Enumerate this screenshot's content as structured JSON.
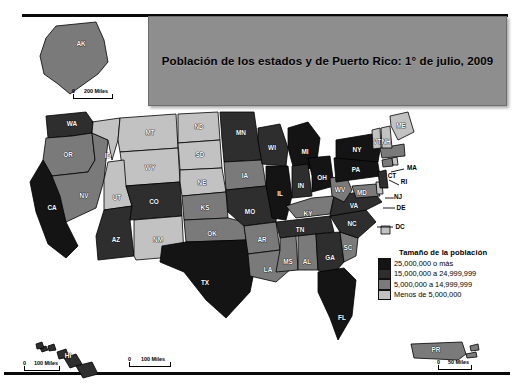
{
  "title": {
    "text": "Población de los estados y de Puerto Rico: 1° de julio, 2009"
  },
  "legend": {
    "title": "Tamaño de la población",
    "classes": [
      {
        "label": "25,000,000 o más",
        "color": "#141414"
      },
      {
        "label": "15,000,000 a 24,999,999",
        "color": "#2e2e2e"
      },
      {
        "label": "5,000,000 a 14,999,999",
        "color": "#7a7a7a"
      },
      {
        "label": "Menos de 5,000,000",
        "color": "#c2c2c2"
      }
    ]
  },
  "scales": {
    "main": {
      "zero": "0",
      "text": "100 Miles"
    },
    "alaska": {
      "zero": "0",
      "text": "200 Miles"
    },
    "hawaii": {
      "zero": "0",
      "text": "100 Miles"
    },
    "puertorico": {
      "zero": "0",
      "text": "50 Miles"
    }
  },
  "map_data": {
    "type": "choropleth",
    "ocean_color": "#ffffff",
    "border_color": "#000000",
    "states": [
      {
        "code": "AK",
        "class": 2,
        "color": "#7a7a7a"
      },
      {
        "code": "HI",
        "class": 1,
        "color": "#2e2e2e"
      },
      {
        "code": "PR",
        "class": 2,
        "color": "#7a7a7a"
      },
      {
        "code": "WA",
        "class": 1,
        "color": "#2e2e2e"
      },
      {
        "code": "OR",
        "class": 2,
        "color": "#7a7a7a"
      },
      {
        "code": "CA",
        "class": 0,
        "color": "#141414"
      },
      {
        "code": "NV",
        "class": 2,
        "color": "#7a7a7a"
      },
      {
        "code": "ID",
        "class": 3,
        "color": "#c2c2c2"
      },
      {
        "code": "MT",
        "class": 3,
        "color": "#c2c2c2"
      },
      {
        "code": "WY",
        "class": 3,
        "color": "#c2c2c2"
      },
      {
        "code": "UT",
        "class": 3,
        "color": "#c2c2c2"
      },
      {
        "code": "AZ",
        "class": 1,
        "color": "#2e2e2e"
      },
      {
        "code": "CO",
        "class": 1,
        "color": "#2e2e2e"
      },
      {
        "code": "NM",
        "class": 3,
        "color": "#c2c2c2"
      },
      {
        "code": "ND",
        "class": 3,
        "color": "#c2c2c2"
      },
      {
        "code": "SD",
        "class": 3,
        "color": "#c2c2c2"
      },
      {
        "code": "NE",
        "class": 3,
        "color": "#c2c2c2"
      },
      {
        "code": "KS",
        "class": 2,
        "color": "#7a7a7a"
      },
      {
        "code": "OK",
        "class": 2,
        "color": "#7a7a7a"
      },
      {
        "code": "TX",
        "class": 0,
        "color": "#141414"
      },
      {
        "code": "MN",
        "class": 1,
        "color": "#2e2e2e"
      },
      {
        "code": "IA",
        "class": 2,
        "color": "#7a7a7a"
      },
      {
        "code": "MO",
        "class": 1,
        "color": "#2e2e2e"
      },
      {
        "code": "AR",
        "class": 2,
        "color": "#7a7a7a"
      },
      {
        "code": "LA",
        "class": 2,
        "color": "#7a7a7a"
      },
      {
        "code": "WI",
        "class": 1,
        "color": "#2e2e2e"
      },
      {
        "code": "IL",
        "class": 0,
        "color": "#141414"
      },
      {
        "code": "MI",
        "class": 0,
        "color": "#141414"
      },
      {
        "code": "IN",
        "class": 1,
        "color": "#2e2e2e"
      },
      {
        "code": "OH",
        "class": 0,
        "color": "#141414"
      },
      {
        "code": "KY",
        "class": 2,
        "color": "#7a7a7a"
      },
      {
        "code": "TN",
        "class": 1,
        "color": "#2e2e2e"
      },
      {
        "code": "MS",
        "class": 2,
        "color": "#7a7a7a"
      },
      {
        "code": "AL",
        "class": 2,
        "color": "#7a7a7a"
      },
      {
        "code": "GA",
        "class": 1,
        "color": "#2e2e2e"
      },
      {
        "code": "FL",
        "class": 0,
        "color": "#141414"
      },
      {
        "code": "SC",
        "class": 2,
        "color": "#7a7a7a"
      },
      {
        "code": "NC",
        "class": 1,
        "color": "#2e2e2e"
      },
      {
        "code": "VA",
        "class": 1,
        "color": "#2e2e2e"
      },
      {
        "code": "WV",
        "class": 2,
        "color": "#7a7a7a"
      },
      {
        "code": "MD",
        "class": 2,
        "color": "#7a7a7a"
      },
      {
        "code": "DE",
        "class": 3,
        "color": "#c2c2c2"
      },
      {
        "code": "DC",
        "class": 3,
        "color": "#c2c2c2"
      },
      {
        "code": "PA",
        "class": 0,
        "color": "#141414"
      },
      {
        "code": "NJ",
        "class": 1,
        "color": "#2e2e2e"
      },
      {
        "code": "NY",
        "class": 0,
        "color": "#141414"
      },
      {
        "code": "CT",
        "class": 2,
        "color": "#7a7a7a"
      },
      {
        "code": "RI",
        "class": 3,
        "color": "#c2c2c2"
      },
      {
        "code": "MA",
        "class": 2,
        "color": "#7a7a7a"
      },
      {
        "code": "VT",
        "class": 3,
        "color": "#c2c2c2"
      },
      {
        "code": "NH",
        "class": 3,
        "color": "#c2c2c2"
      },
      {
        "code": "ME",
        "class": 3,
        "color": "#c2c2c2"
      }
    ],
    "callout_labels": [
      "MA",
      "RI",
      "NJ",
      "DE",
      "DC"
    ]
  }
}
